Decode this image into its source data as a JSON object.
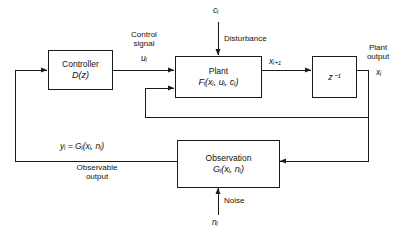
{
  "figure": {
    "type": "block-diagram",
    "background_color": "#ffffff",
    "line_color": "#1a1a1a"
  },
  "blocks": {
    "controller": {
      "name": "Controller",
      "transfer": "D(z)"
    },
    "plant": {
      "name": "Plant",
      "function": "Fᵢ(xᵢ, uᵢ, cᵢ)"
    },
    "delay": {
      "name": "z⁻¹"
    },
    "observation": {
      "name": "Observation",
      "function": "Gᵢ(xᵢ, nᵢ)"
    }
  },
  "signals": {
    "control_signal_line1": "Control",
    "control_signal_line2": "signal",
    "control_signal_symbol": "uᵢ",
    "disturbance_symbol": "cᵢ",
    "disturbance_label": "Disturbance",
    "state_next_symbol": "xᵢ₊₁",
    "plant_output_line1": "Plant",
    "plant_output_line2": "output",
    "plant_output_symbol": "xᵢ",
    "noise_label": "Noise",
    "noise_symbol": "nᵢ",
    "observable_equation": "yᵢ = Gᵢ(xᵢ, nᵢ)",
    "observable_output_line1": "Observable",
    "observable_output_line2": "output"
  }
}
